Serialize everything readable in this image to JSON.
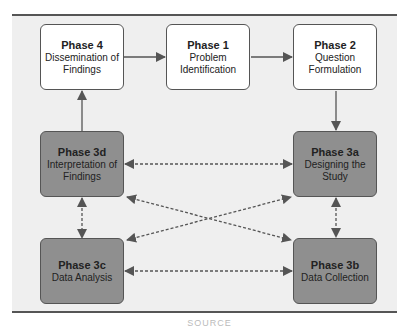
{
  "diagram": {
    "nodes": [
      {
        "id": "phase4",
        "title": "Phase 4",
        "description": "Dissemination of Findings",
        "style": "white"
      },
      {
        "id": "phase1",
        "title": "Phase 1",
        "description": "Problem Identification",
        "style": "white"
      },
      {
        "id": "phase2",
        "title": "Phase 2",
        "description": "Question Formulation",
        "style": "white"
      },
      {
        "id": "phase3d",
        "title": "Phase 3d",
        "description": "Interpretation of Findings",
        "style": "gray"
      },
      {
        "id": "phase3a",
        "title": "Phase 3a",
        "description": "Designing the Study",
        "style": "gray"
      },
      {
        "id": "phase3c",
        "title": "Phase 3c",
        "description": "Data Analysis",
        "style": "gray"
      },
      {
        "id": "phase3b",
        "title": "Phase 3b",
        "description": "Data Collection",
        "style": "gray"
      }
    ],
    "edges": [
      {
        "from": "phase4",
        "to": "phase1",
        "type": "solid",
        "direction": "forward"
      },
      {
        "from": "phase1",
        "to": "phase2",
        "type": "solid",
        "direction": "forward"
      },
      {
        "from": "phase2",
        "to": "phase3a",
        "type": "solid",
        "direction": "forward"
      },
      {
        "from": "phase3d",
        "to": "phase4",
        "type": "solid",
        "direction": "forward"
      },
      {
        "from": "phase3d",
        "to": "phase3a",
        "type": "dashed",
        "direction": "both"
      },
      {
        "from": "phase3d",
        "to": "phase3b",
        "type": "dashed",
        "direction": "both"
      },
      {
        "from": "phase3c",
        "to": "phase3a",
        "type": "dashed",
        "direction": "both"
      },
      {
        "from": "phase3d",
        "to": "phase3c",
        "type": "dashed",
        "direction": "both"
      },
      {
        "from": "phase3a",
        "to": "phase3b",
        "type": "dashed",
        "direction": "both"
      },
      {
        "from": "phase3c",
        "to": "phase3b",
        "type": "dashed",
        "direction": "both"
      }
    ],
    "colors": {
      "panel_background": "#efefef",
      "white_box": "#ffffff",
      "gray_box": "#8f8f8f",
      "line": "#555555"
    }
  },
  "caption": "SOURCE"
}
